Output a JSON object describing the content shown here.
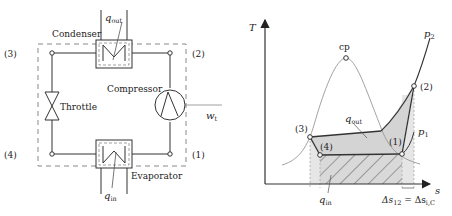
{
  "schematic": {
    "components": {
      "condenser": "Condenser",
      "compressor": "Compressor",
      "throttle": "Throttle",
      "evaporator": "Evaporator"
    },
    "states": [
      "(1)",
      "(2)",
      "(3)",
      "(4)"
    ],
    "heat_out": {
      "symbol": "q",
      "subscript": "out"
    },
    "heat_in": {
      "symbol": "q",
      "subscript": "in"
    },
    "work": {
      "symbol": "w",
      "subscript": "t"
    }
  },
  "ts_diagram": {
    "y_axis": "T",
    "x_axis": "s",
    "critical_point": "cp",
    "isobar_high": {
      "symbol": "p",
      "subscript": "2"
    },
    "isobar_low": {
      "symbol": "p",
      "subscript": "1"
    },
    "states": [
      "(1)",
      "(2)",
      "(3)",
      "(4)"
    ],
    "heat_out": {
      "symbol": "q",
      "subscript": "out"
    },
    "heat_in": {
      "symbol": "q",
      "subscript": "in"
    },
    "entropy_note": {
      "left": "Δs",
      "left_sub": "12",
      "eq": " = Δs",
      "right_sub": "i,C"
    }
  },
  "colors": {
    "line": "#333333",
    "dashed": "#888888",
    "shade": "#d9d9d9",
    "shade_light": "#e8e8e8",
    "curve": "#999999"
  }
}
